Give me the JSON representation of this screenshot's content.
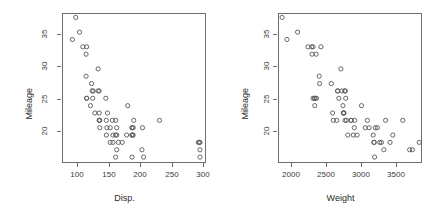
{
  "figure": {
    "background_color": "#ffffff",
    "axis_color": "#6e6e6e",
    "point_color": "#585858",
    "width": 438,
    "height": 220
  },
  "chart_data": [
    {
      "type": "scatter",
      "title": "",
      "xlabel": "Disp.",
      "ylabel": "Mileage",
      "xlim": [
        53,
        316
      ],
      "ylim": [
        17.2,
        37.6
      ],
      "xticks": [
        100,
        150,
        200,
        250,
        300
      ],
      "yticks": [
        20,
        25,
        30,
        35
      ],
      "grid": false,
      "legend": null,
      "marker": "open-circle",
      "n_points": 60,
      "x": [
        78,
        72,
        85,
        91,
        97,
        97,
        98,
        98,
        98,
        105,
        107,
        108,
        109,
        110,
        113,
        119,
        119,
        121,
        121,
        121,
        121,
        122,
        122,
        133,
        134,
        134,
        135,
        136,
        141,
        141,
        145,
        146,
        146,
        151,
        151,
        151,
        153,
        153,
        153,
        156,
        163,
        171,
        173,
        181,
        181,
        181,
        181,
        181,
        183,
        183,
        184,
        199,
        200,
        202,
        231,
        302,
        304,
        305,
        305,
        305
      ],
      "y": [
        37,
        34,
        35,
        33,
        32,
        29,
        33,
        26,
        26,
        25,
        28,
        27,
        26,
        27,
        24,
        30,
        27,
        27,
        24,
        23,
        23,
        23,
        22,
        26,
        23,
        21,
        22,
        24,
        22,
        20,
        23,
        21,
        20,
        23,
        21,
        18,
        22,
        21,
        19,
        20,
        20,
        21,
        25,
        22,
        22,
        21,
        21,
        18,
        22,
        21,
        23,
        19,
        22,
        18,
        23,
        20,
        20,
        20,
        19,
        18
      ]
    },
    {
      "type": "scatter",
      "title": "",
      "xlabel": "Weight",
      "ylabel": "Mileage",
      "xlim": [
        1785,
        3880
      ],
      "ylim": [
        17.2,
        37.6
      ],
      "xticks": [
        2000,
        2500,
        3000,
        3500
      ],
      "yticks": [
        20,
        25,
        30,
        35
      ],
      "grid": false,
      "legend": null,
      "marker": "open-circle",
      "n_points": 60,
      "x": [
        1845,
        1915,
        2070,
        2220,
        2275,
        2280,
        2295,
        2295,
        2315,
        2320,
        2325,
        2340,
        2345,
        2385,
        2390,
        2410,
        2560,
        2580,
        2590,
        2640,
        2650,
        2655,
        2670,
        2700,
        2715,
        2730,
        2735,
        2740,
        2745,
        2755,
        2760,
        2765,
        2770,
        2780,
        2800,
        2845,
        2850,
        2880,
        2895,
        2900,
        2935,
        3000,
        3055,
        3085,
        3110,
        3170,
        3180,
        3185,
        3190,
        3200,
        3230,
        3265,
        3290,
        3325,
        3350,
        3415,
        3455,
        3600,
        3700,
        3740,
        3840
      ],
      "y": [
        37,
        34,
        35,
        33,
        33,
        32,
        33,
        26,
        26,
        25,
        26,
        32,
        26,
        29,
        28,
        33,
        28,
        24,
        23,
        23,
        27,
        27,
        26,
        30,
        27,
        25,
        24,
        24,
        24,
        27,
        23,
        27,
        26,
        23,
        21,
        23,
        23,
        21,
        22,
        23,
        21,
        25,
        22,
        23,
        22,
        21,
        20,
        20,
        18,
        22,
        22,
        20,
        20,
        19,
        23,
        20,
        21,
        23,
        19,
        19,
        20
      ]
    }
  ],
  "panels": [
    {
      "name": "mileage-vs-disp",
      "xlabel": "Disp.",
      "ylabel": "Mileage",
      "xticklabels": [
        "100",
        "150",
        "200",
        "250",
        "300"
      ],
      "yticklabels": [
        "20",
        "25",
        "30",
        "35"
      ]
    },
    {
      "name": "mileage-vs-weight",
      "xlabel": "Weight",
      "ylabel": "Mileage",
      "xticklabels": [
        "2000",
        "2500",
        "3000",
        "3500"
      ],
      "yticklabels": [
        "20",
        "25",
        "30",
        "35"
      ]
    }
  ]
}
